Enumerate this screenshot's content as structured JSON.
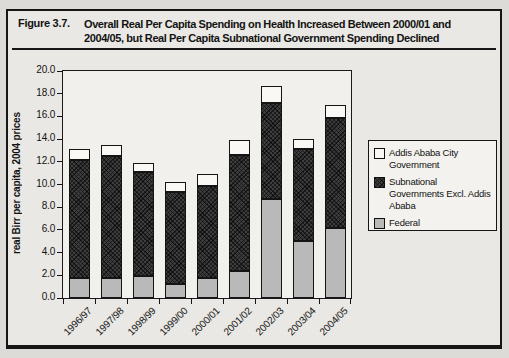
{
  "figure": {
    "label": "Figure 3.7.",
    "title_line1": "Overall Real Per Capita Spending on Health Increased Between 2000/01 and",
    "title_line2": "2004/05, but Real Per Capita Subnational Government Spending Declined"
  },
  "legend": {
    "items": [
      {
        "label": "Addis Ababa City Government",
        "pattern": "plain"
      },
      {
        "label": "Subnational Governments Excl. Addis Ababa",
        "pattern": "cross"
      },
      {
        "label": "Federal",
        "pattern": "dots"
      }
    ]
  },
  "chart_data": {
    "type": "bar",
    "stacked": true,
    "title": "",
    "xlabel": "",
    "ylabel": "real Birr per capita, 2004 prices",
    "ylim": [
      0,
      20
    ],
    "ytick_step": 2,
    "grid": false,
    "legend_position": "right",
    "categories": [
      "1996/97",
      "1997/98",
      "1998/99",
      "1999/00",
      "2000/01",
      "2001/02",
      "2002/03",
      "2003/04",
      "2004/05"
    ],
    "series": [
      {
        "name": "Federal",
        "pattern": "dots",
        "color": "#b9b9b9",
        "values": [
          1.8,
          1.8,
          1.9,
          1.2,
          1.8,
          2.4,
          8.7,
          5.0,
          6.2
        ]
      },
      {
        "name": "Subnational Governments Excl. Addis Ababa",
        "pattern": "cross",
        "color": "#3d3d3d",
        "values": [
          10.4,
          10.7,
          9.2,
          8.1,
          8.1,
          10.2,
          8.5,
          8.1,
          9.7
        ]
      },
      {
        "name": "Addis Ababa City Government",
        "pattern": "plain",
        "color": "#f9f8f4",
        "values": [
          0.9,
          1.0,
          0.8,
          0.9,
          1.0,
          1.3,
          1.5,
          0.9,
          1.1
        ]
      }
    ]
  }
}
